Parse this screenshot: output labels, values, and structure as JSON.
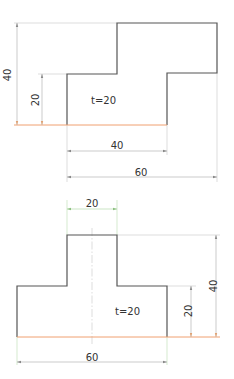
{
  "colors": {
    "outline": "#555555",
    "base_edge": "#f0a070",
    "dimension": "#a8a8a8",
    "dimension_green": "#a8d4a0"
  },
  "figure_top": {
    "thickness_label": "t=20",
    "dims": {
      "height_total": "40",
      "height_step": "20",
      "width_bottom": "40",
      "width_total": "60"
    }
  },
  "figure_bottom": {
    "thickness_label": "t=20",
    "dims": {
      "width_top": "20",
      "height_total": "40",
      "height_step": "20",
      "width_total": "60"
    }
  }
}
